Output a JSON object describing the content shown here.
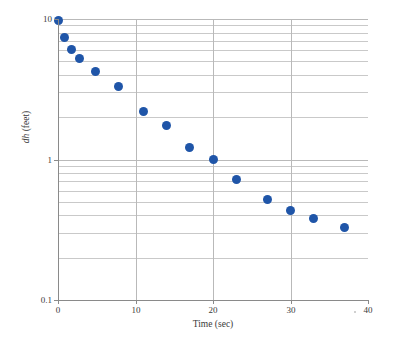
{
  "chart_data": {
    "type": "scatter",
    "title": "",
    "xlabel": "Time (sec)",
    "ylabel": "dh (feet)",
    "ylabel_italic_part": "dh",
    "ylabel_rest": " (feet)",
    "yscale": "log",
    "xscale": "linear",
    "xlim": [
      0,
      40
    ],
    "ylim": [
      0.1,
      10
    ],
    "grid": true,
    "legend": null,
    "marker_color": "#1f55a8",
    "gridline_color": "#b9b9b9",
    "axis_color": "#8a8a8a",
    "xticks": [
      0,
      10,
      20,
      30,
      40
    ],
    "xtick_labels": [
      "0",
      "10",
      "20",
      "30",
      "40"
    ],
    "yticks": [
      0.1,
      1,
      10
    ],
    "ytick_labels": [
      "0.1",
      "1",
      "10"
    ],
    "y_minor_gridlines": [
      0.2,
      0.3,
      0.4,
      0.5,
      0.6,
      0.7,
      0.8,
      0.9,
      2,
      3,
      4,
      5,
      6,
      7,
      8,
      9
    ],
    "x_gridlines": [
      10,
      20,
      30
    ],
    "x": [
      0,
      0.8,
      1.8,
      2.8,
      4.8,
      7.8,
      11,
      14,
      17,
      20,
      23,
      27,
      30,
      33,
      37
    ],
    "y": [
      9.7,
      7.4,
      6.1,
      5.2,
      4.2,
      3.3,
      2.2,
      1.75,
      1.22,
      1.0,
      0.72,
      0.52,
      0.43,
      0.38,
      0.33
    ],
    "points": [
      {
        "x": 0,
        "y": 9.7
      },
      {
        "x": 0.8,
        "y": 7.4
      },
      {
        "x": 1.8,
        "y": 6.1
      },
      {
        "x": 2.8,
        "y": 5.2
      },
      {
        "x": 4.8,
        "y": 4.2
      },
      {
        "x": 7.8,
        "y": 3.3
      },
      {
        "x": 11,
        "y": 2.2
      },
      {
        "x": 14,
        "y": 1.75
      },
      {
        "x": 17,
        "y": 1.22
      },
      {
        "x": 20,
        "y": 1.0
      },
      {
        "x": 23,
        "y": 0.72
      },
      {
        "x": 27,
        "y": 0.52
      },
      {
        "x": 30,
        "y": 0.43
      },
      {
        "x": 33,
        "y": 0.38
      },
      {
        "x": 37,
        "y": 0.33
      }
    ]
  }
}
